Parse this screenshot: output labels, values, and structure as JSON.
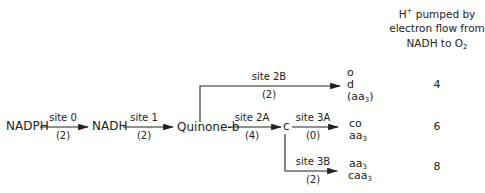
{
  "header": {
    "line1_prefix": "H",
    "line1_sup": "+",
    "line1_suffix": " pumped by",
    "line2": "electron flow from",
    "line3_prefix": "NADH to O",
    "line3_sub": "2"
  },
  "nodes": {
    "nadph": "NADPH",
    "nadh": "NADH",
    "quinone": "Quinone-b",
    "c": "c"
  },
  "sites": {
    "site0": {
      "name": "site 0",
      "value": "(2)"
    },
    "site1": {
      "name": "site 1",
      "value": "(2)"
    },
    "site2A": {
      "name": "site 2A",
      "value": "(4)"
    },
    "site2B": {
      "name": "site 2B",
      "value": "(2)"
    },
    "site3A": {
      "name": "site 3A",
      "value": "(0)"
    },
    "site3B": {
      "name": "site 3B",
      "value": "(2)"
    }
  },
  "terminals": {
    "branch2B": {
      "line1": "o",
      "line2": "d",
      "line3_prefix": "(aa",
      "line3_sub": "3",
      "line3_suffix": ")"
    },
    "branch3A": {
      "line1": "co",
      "line2_prefix": "aa",
      "line2_sub": "3"
    },
    "branch3B": {
      "line1_prefix": "aa",
      "line1_sub": "3",
      "line2_prefix": "caa",
      "line2_sub": "3"
    }
  },
  "protons": {
    "branch2B": "4",
    "branch3A": "6",
    "branch3B": "8"
  },
  "colors": {
    "line": "#222222",
    "text": "#222222"
  }
}
